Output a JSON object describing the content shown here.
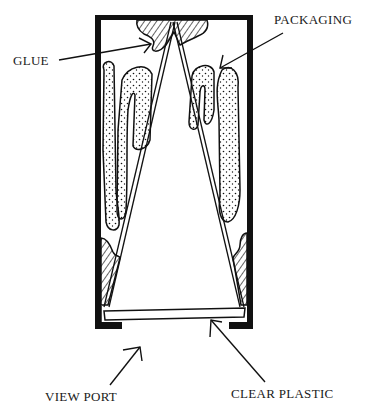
{
  "diagram": {
    "type": "cross-section illustration",
    "labels": {
      "glue": "GLUE",
      "packaging": "PACKAGING",
      "view_port": "VIEW PORT",
      "clear_plastic": "CLEAR PLASTIC"
    },
    "components": [
      {
        "id": "outer-box",
        "description": "rectangular enclosure with thick black walls, open view port at bottom"
      },
      {
        "id": "triangular-prism",
        "description": "double-line triangle apex at top, base resting on clear plastic"
      },
      {
        "id": "glue-top",
        "fill": "hatched"
      },
      {
        "id": "glue-bottom-left",
        "fill": "hatched"
      },
      {
        "id": "glue-bottom-right",
        "fill": "hatched"
      },
      {
        "id": "packaging-left",
        "fill": "stippled"
      },
      {
        "id": "packaging-right",
        "fill": "stippled"
      },
      {
        "id": "clear-plastic-window",
        "description": "thin plate across bottom"
      }
    ],
    "colors": {
      "ink": "#111111",
      "paper": "#ffffff"
    }
  }
}
